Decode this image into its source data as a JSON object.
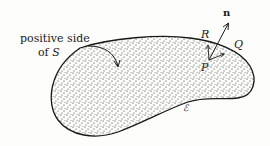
{
  "labels": {
    "positive_side_line1": "positive side",
    "positive_side_line2_prefix": "of ",
    "surface_name": "S",
    "normal": "n",
    "point_p": "P",
    "point_q": "Q",
    "point_r": "R",
    "curve_name": "ℰ"
  },
  "colors": {
    "ink": "#1a1a1a",
    "background": "#fdfdfb"
  }
}
